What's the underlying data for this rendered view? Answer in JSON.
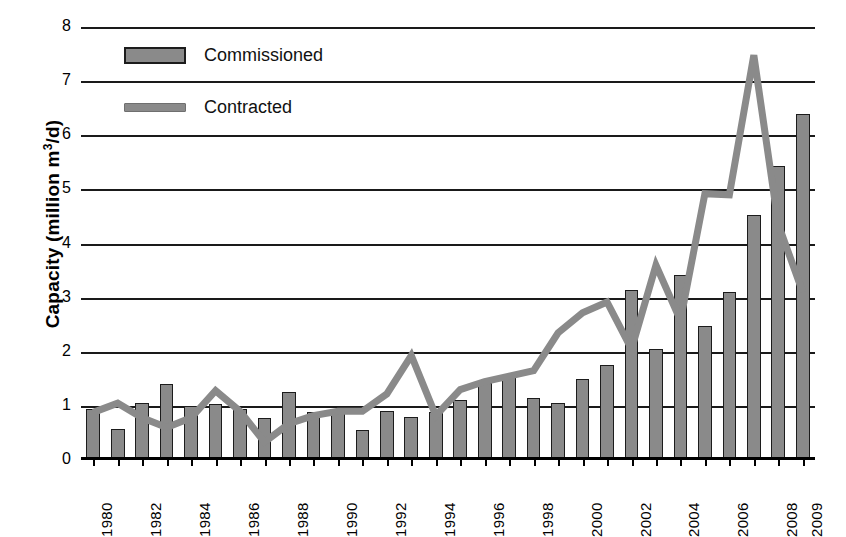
{
  "chart_data": {
    "type": "bar",
    "title": "",
    "subtitle": "",
    "xlabel": "",
    "ylabel": "Capacity (million m3/d)",
    "ylabel_parts": {
      "pre": "Capacity (million m",
      "sup": "3",
      "post": "/d)"
    },
    "ylim": [
      0,
      8
    ],
    "y_ticks": [
      0,
      1,
      2,
      3,
      4,
      5,
      6,
      7,
      8
    ],
    "y_tick_labels": [
      "0",
      "1",
      "2",
      "3",
      "4",
      "5",
      "6",
      "7",
      "8"
    ],
    "grid": true,
    "legend_position": "top-left",
    "categories": [
      "1980",
      "1981",
      "1982",
      "1983",
      "1984",
      "1985",
      "1986",
      "1987",
      "1988",
      "1989",
      "1990",
      "1991",
      "1992",
      "1993",
      "1994",
      "1995",
      "1996",
      "1997",
      "1998",
      "1999",
      "2000",
      "2001",
      "2002",
      "2003",
      "2004",
      "2005",
      "2006",
      "2007",
      "2008",
      "2009"
    ],
    "x_tick_labels_shown": [
      "1980",
      "1982",
      "1984",
      "1986",
      "1988",
      "1990",
      "1992",
      "1994",
      "1996",
      "1998",
      "2000",
      "2002",
      "2004",
      "2006",
      "2008",
      "2009"
    ],
    "series": [
      {
        "name": "Commissioned",
        "type": "bar",
        "color": "#8a8a8a",
        "values": [
          0.95,
          0.57,
          1.05,
          1.4,
          1.0,
          1.03,
          0.95,
          0.78,
          1.25,
          0.88,
          0.9,
          0.55,
          0.9,
          0.8,
          0.88,
          1.1,
          1.43,
          1.57,
          1.15,
          1.05,
          1.5,
          1.75,
          3.15,
          2.05,
          3.42,
          2.47,
          3.1,
          4.52,
          5.43,
          6.4
        ]
      },
      {
        "name": "Contracted",
        "type": "line",
        "color": "#8a8a8a",
        "values": [
          0.88,
          1.05,
          0.78,
          0.6,
          0.78,
          1.28,
          0.9,
          0.33,
          0.67,
          0.82,
          0.9,
          0.9,
          1.22,
          1.93,
          0.82,
          1.3,
          1.45,
          1.55,
          1.65,
          2.35,
          2.72,
          2.92,
          2.05,
          3.6,
          2.58,
          4.92,
          4.9,
          7.48,
          4.35,
          3.1
        ]
      }
    ]
  },
  "legend": {
    "items": [
      {
        "label": "Commissioned",
        "marker": "bar-swatch"
      },
      {
        "label": "Contracted",
        "marker": "line-swatch"
      }
    ]
  }
}
